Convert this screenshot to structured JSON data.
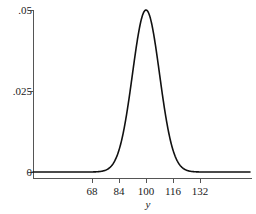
{
  "chart_data": {
    "type": "line",
    "title": "",
    "subtitle": "",
    "xlabel": "y",
    "ylabel": "",
    "curve": "normal-density",
    "distribution": {
      "mean": 100,
      "sigma": 8,
      "peak_value": 0.05
    },
    "xlim": [
      60,
      144
    ],
    "ylim": [
      0,
      0.05
    ],
    "grid": false,
    "legend": null,
    "x_ticks": [
      68,
      84,
      100,
      116,
      132
    ],
    "x_tick_labels": [
      "68",
      "84",
      "100",
      "116",
      "132"
    ],
    "y_ticks": [
      0,
      0.025,
      0.05
    ],
    "y_tick_labels": [
      "0",
      ".025",
      ".05"
    ],
    "series": [
      {
        "name": "density",
        "x": [
          60,
          64,
          68,
          72,
          76,
          80,
          84,
          88,
          92,
          96,
          100,
          104,
          108,
          112,
          116,
          120,
          124,
          128,
          132,
          136,
          140,
          144
        ],
        "values": [
          0.0,
          0.0,
          0.0,
          0.0001,
          0.0002,
          0.0009,
          0.0027,
          0.0065,
          0.013,
          0.0228,
          0.0499,
          0.0228,
          0.013,
          0.0065,
          0.0027,
          0.0009,
          0.0002,
          0.0001,
          0.0,
          0.0,
          0.0,
          0.0
        ]
      }
    ],
    "colors": {
      "curve": "#111111",
      "axis": "#555555",
      "text": "#1a1a1a",
      "background": "#ffffff"
    }
  },
  "geometry": {
    "axis_x_px": 33,
    "axis_y_px": 178,
    "baseline_y_px": 172,
    "top_y_px": 10,
    "mid_y_px": 91,
    "x_origin_px": 92,
    "x_step_px": 27,
    "plot_right_px": 250,
    "axis_label_x_px": 148,
    "axis_label_y_px": 199
  }
}
